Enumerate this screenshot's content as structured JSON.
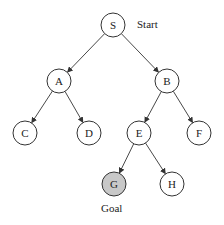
{
  "diagram": {
    "type": "search-tree",
    "nodes": [
      {
        "id": "S",
        "label": "S",
        "x": 113,
        "y": 25
      },
      {
        "id": "A",
        "label": "A",
        "x": 59,
        "y": 81
      },
      {
        "id": "B",
        "label": "B",
        "x": 167,
        "y": 81
      },
      {
        "id": "C",
        "label": "C",
        "x": 25,
        "y": 133
      },
      {
        "id": "D",
        "label": "D",
        "x": 89,
        "y": 133
      },
      {
        "id": "E",
        "label": "E",
        "x": 139,
        "y": 133
      },
      {
        "id": "F",
        "label": "F",
        "x": 199,
        "y": 133
      },
      {
        "id": "G",
        "label": "G",
        "x": 114,
        "y": 184,
        "highlight": true
      },
      {
        "id": "H",
        "label": "H",
        "x": 172,
        "y": 184
      }
    ],
    "edges": [
      [
        "S",
        "A"
      ],
      [
        "S",
        "B"
      ],
      [
        "A",
        "C"
      ],
      [
        "A",
        "D"
      ],
      [
        "B",
        "E"
      ],
      [
        "B",
        "F"
      ],
      [
        "E",
        "G"
      ],
      [
        "E",
        "H"
      ]
    ],
    "annotations": {
      "start_label": "Start",
      "goal_label": "Goal"
    },
    "colors": {
      "stroke": "#333333",
      "goal_fill": "#c8c8c8"
    }
  }
}
